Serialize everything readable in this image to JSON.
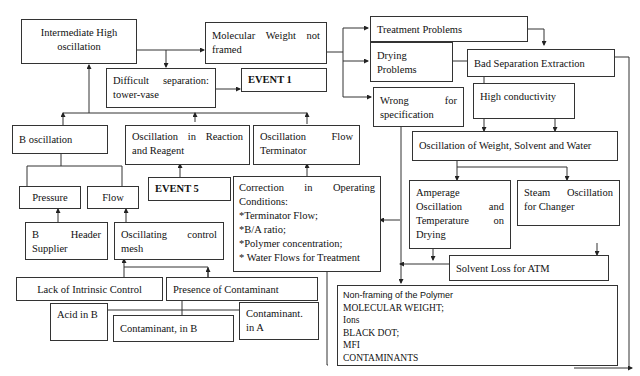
{
  "nodes": {
    "intermediate_high_oscillation": "Intermediate High oscillation",
    "molecular_weight_not_framed": "Molecular Weight not framed",
    "difficult_separation": "Difficult separation: tower-vase",
    "event_1": "EVENT 1",
    "treatment_problems": "Treatment Problems",
    "drying_problems": "Drying Problems",
    "bad_separation_extraction": "Bad Separation Extraction",
    "wrong_for_specification": "Wrong for specification",
    "high_conductivity": "High conductivity",
    "b_oscillation": "B oscillation",
    "oscillation_reaction_reagent": "Oscillation in Reaction and Reagent",
    "oscillation_flow_terminator": "Oscillation Flow Terminator",
    "oscillation_weight_solvent_water": "Oscillation of Weight, Solvent and Water",
    "pressure": "Pressure",
    "flow": "Flow",
    "event_5": "EVENT 5",
    "correction_operating_conditions": {
      "title": "Correction in Operating Conditions:",
      "items": [
        "*Terminator Flow;",
        "*B/A ratio;",
        "*Polymer concentration;",
        "* Water Flows for Treatment"
      ]
    },
    "amperage_oscillation": "Amperage Oscillation and Temperature on Drying",
    "steam_oscillation": "Steam Oscillation for Changer",
    "b_header_supplier": "B Header Supplier",
    "oscillating_control_mesh": "Oscillating control mesh",
    "solvent_loss_atm": "Solvent Loss for ATM",
    "lack_intrinsic_control": "Lack of Intrinsic Control",
    "presence_contaminant": "Presence of Contaminant",
    "acid_in_b": "Acid in B",
    "contaminant_in_b": "Contaminant, in B",
    "contaminant_in_a": "Contaminant. in A",
    "non_framing_polymer": {
      "title": "Non-framing of the Polymer",
      "items": [
        "MOLECULAR WEIGHT;",
        "Ions",
        "BLACK DOT;",
        "MFI",
        "CONTAMINANTS"
      ]
    }
  }
}
